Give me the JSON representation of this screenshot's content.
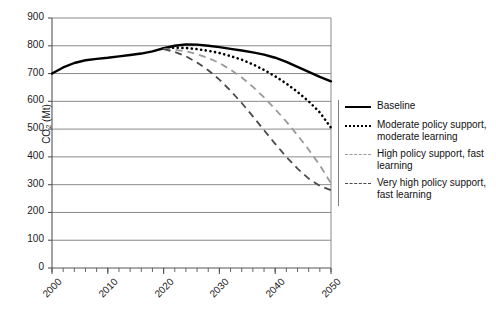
{
  "chart_data": {
    "type": "line",
    "title": "",
    "xlabel": "",
    "ylabel": "CO2 (Mt)",
    "ylabel_main": "CO",
    "ylabel_sub": "2",
    "ylabel_unit": " (Mt)",
    "xlim": [
      2000,
      2050
    ],
    "ylim": [
      0,
      900
    ],
    "ytick_step": 100,
    "xtick_step": 10,
    "x_minor_step": 2,
    "grid": "horizontal",
    "legend_position": "right",
    "ytick_labels": [
      "900",
      "800",
      "700",
      "600",
      "500",
      "400",
      "300",
      "200",
      "100",
      "0"
    ],
    "ytick_values": [
      900,
      800,
      700,
      600,
      500,
      400,
      300,
      200,
      100,
      0
    ],
    "xtick_labels": [
      "2000",
      "2010",
      "2020",
      "2030",
      "2040",
      "2050"
    ],
    "xtick_values": [
      2000,
      2010,
      2020,
      2030,
      2040,
      2050
    ],
    "series": [
      {
        "name": "Baseline",
        "style": "solid",
        "color": "#000000",
        "width": 2.4,
        "x": [
          2000,
          2002,
          2004,
          2006,
          2008,
          2010,
          2012,
          2014,
          2016,
          2018,
          2020,
          2022,
          2024,
          2026,
          2028,
          2030,
          2032,
          2034,
          2036,
          2038,
          2040,
          2042,
          2044,
          2046,
          2048,
          2050
        ],
        "values": [
          700,
          722,
          738,
          748,
          753,
          757,
          762,
          767,
          772,
          780,
          791,
          800,
          805,
          804,
          800,
          795,
          789,
          783,
          776,
          768,
          757,
          742,
          724,
          706,
          688,
          672
        ]
      },
      {
        "name": "Moderate policy support, moderate learning",
        "style": "dotted",
        "color": "#000000",
        "width": 2.4,
        "x": [
          2020,
          2022,
          2024,
          2026,
          2028,
          2030,
          2032,
          2034,
          2036,
          2038,
          2040,
          2042,
          2044,
          2046,
          2048,
          2050
        ],
        "values": [
          791,
          793,
          792,
          788,
          782,
          774,
          763,
          750,
          733,
          713,
          690,
          664,
          634,
          600,
          560,
          505
        ]
      },
      {
        "name": "High policy support, fast learning",
        "style": "dashed",
        "color": "#9a9a9a",
        "width": 1.8,
        "x": [
          2020,
          2022,
          2024,
          2026,
          2028,
          2030,
          2032,
          2034,
          2036,
          2038,
          2040,
          2042,
          2044,
          2046,
          2048,
          2050
        ],
        "values": [
          789,
          786,
          780,
          770,
          756,
          738,
          714,
          686,
          652,
          614,
          572,
          527,
          478,
          426,
          370,
          305
        ]
      },
      {
        "name": "Very high policy support, fast learning",
        "style": "dashed",
        "color": "#4a4a4a",
        "width": 1.8,
        "x": [
          2020,
          2022,
          2024,
          2026,
          2028,
          2030,
          2032,
          2034,
          2036,
          2038,
          2040,
          2042,
          2044,
          2046,
          2048,
          2050
        ],
        "values": [
          788,
          778,
          762,
          740,
          712,
          678,
          638,
          594,
          546,
          496,
          447,
          400,
          358,
          322,
          296,
          280
        ]
      }
    ]
  },
  "legend": {
    "items": [
      {
        "label_line1": "Baseline",
        "label_line2": "",
        "swatch": "solid-line-swatch"
      },
      {
        "label_line1": "Moderate policy support,",
        "label_line2": "moderate learning",
        "swatch": "dotted-line-swatch"
      },
      {
        "label_line1": "High policy support, fast",
        "label_line2": "learning",
        "swatch": "gray-dashed-line-swatch"
      },
      {
        "label_line1": "Very high policy support,",
        "label_line2": "fast learning",
        "swatch": "dark-dashed-line-swatch"
      }
    ]
  },
  "colors": {
    "baseline": "#000000",
    "moderate": "#000000",
    "high": "#9a9a9a",
    "very_high": "#4a4a4a",
    "grid": "#8a8a8a",
    "axis": "#555555"
  }
}
